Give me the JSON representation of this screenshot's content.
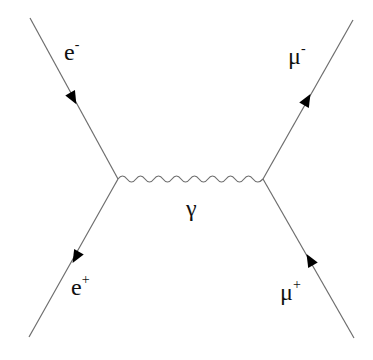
{
  "diagram": {
    "type": "feynman",
    "vertices": [
      {
        "id": "left",
        "x": 118,
        "y": 179
      },
      {
        "id": "right",
        "x": 263,
        "y": 179
      }
    ],
    "propagator": {
      "label": "γ",
      "style": "wavy"
    },
    "external_lines": [
      {
        "id": "e-minus",
        "base": "e",
        "charge": "-",
        "end": {
          "x": 30,
          "y": 18
        },
        "vertex": "left",
        "arrow": "toward-vertex"
      },
      {
        "id": "e-plus",
        "base": "e",
        "charge": "+",
        "end": {
          "x": 29,
          "y": 337
        },
        "vertex": "left",
        "arrow": "away-from-vertex"
      },
      {
        "id": "mu-minus",
        "base": "μ",
        "charge": "-",
        "end": {
          "x": 353,
          "y": 20
        },
        "vertex": "right",
        "arrow": "away-from-vertex"
      },
      {
        "id": "mu-plus",
        "base": "μ",
        "charge": "+",
        "end": {
          "x": 354,
          "y": 338
        },
        "vertex": "right",
        "arrow": "toward-vertex"
      }
    ],
    "labels": {
      "e_minus": {
        "base": "e",
        "sup": "-"
      },
      "e_plus": {
        "base": "e",
        "sup": "+"
      },
      "mu_minus": {
        "base": "μ",
        "sup": "-"
      },
      "mu_plus": {
        "base": "μ",
        "sup": "+"
      },
      "photon": "γ"
    },
    "colors": {
      "line": "#6e6e6e",
      "arrow": "#000000",
      "text": "#111111"
    }
  }
}
